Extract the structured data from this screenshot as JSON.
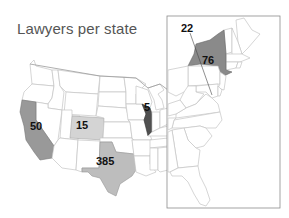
{
  "title": "Lawyers per state",
  "legend_colors": {
    "light": "#d2d2d2",
    "medium": "#a6a6a6",
    "dark": "#777777",
    "darkest": "#4e4e4e",
    "empty": "#ffffff"
  },
  "states": [
    {
      "name": "California",
      "value": "50",
      "shade": "#999999"
    },
    {
      "name": "Colorado",
      "value": "15",
      "shade": "#d4d4d4"
    },
    {
      "name": "Texas",
      "value": "385",
      "shade": "#bdbdbd"
    },
    {
      "name": "Illinois",
      "value": "5",
      "shade": "#505050"
    },
    {
      "name": "New York",
      "value": "76",
      "shade": "#8a8a8a"
    },
    {
      "name": "District of Columbia",
      "value": "22",
      "shade": "#ffffff"
    }
  ],
  "inset": {
    "label": "East Coast detail"
  }
}
